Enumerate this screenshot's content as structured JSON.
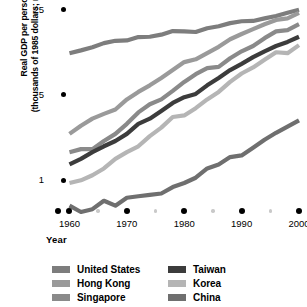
{
  "chart_data": {
    "type": "line",
    "title": "",
    "xlabel": "Year",
    "ylabel": "Real GDP per person (thousands of 1985 dollars; ratio scale)",
    "ylabel_line1": "Real GDP per person",
    "ylabel_line2": "(thousands of 1985 dollars; ratio scale)",
    "scale": "log",
    "grid": false,
    "legend_position": "bottom",
    "xlim": [
      1958,
      2000
    ],
    "ylim": [
      0.55,
      30
    ],
    "xticks": [
      1960,
      1970,
      1980,
      1990,
      2000
    ],
    "xtick_labels": [
      "1960",
      "1970",
      "1980",
      "1990",
      "2000"
    ],
    "xticks_minor": [
      1965,
      1975,
      1985,
      1995
    ],
    "yticks": [
      1,
      5,
      25
    ],
    "ytick_labels": [
      "1",
      "5",
      "25"
    ],
    "x": [
      1960,
      1962,
      1964,
      1966,
      1968,
      1970,
      1972,
      1974,
      1976,
      1978,
      1980,
      1982,
      1984,
      1986,
      1988,
      1990,
      1992,
      1994,
      1996,
      1998,
      2000
    ],
    "series": [
      {
        "name": "United States",
        "color": "#7d7d7d",
        "values": [
          11.0,
          11.6,
          12.3,
          13.3,
          13.9,
          14.0,
          14.9,
          15.0,
          15.6,
          16.7,
          16.6,
          16.4,
          17.6,
          18.3,
          19.4,
          20.1,
          20.2,
          21.2,
          22.2,
          23.6,
          25.0
        ]
      },
      {
        "name": "Hong Kong",
        "color": "#9a9a9a",
        "values": [
          2.4,
          2.8,
          3.2,
          3.5,
          3.8,
          4.6,
          5.3,
          6.0,
          6.9,
          8.0,
          9.3,
          9.8,
          11.0,
          12.4,
          14.3,
          15.8,
          17.3,
          19.0,
          20.6,
          21.2,
          23.5
        ]
      },
      {
        "name": "Singapore",
        "color": "#8a8a8a",
        "values": [
          1.7,
          1.8,
          1.8,
          2.1,
          2.4,
          2.9,
          3.6,
          4.2,
          4.6,
          5.4,
          6.4,
          7.4,
          8.3,
          8.5,
          10.0,
          11.4,
          12.6,
          14.6,
          16.6,
          17.0,
          19.0
        ]
      },
      {
        "name": "Taiwan",
        "color": "#3c3c3c",
        "values": [
          1.35,
          1.5,
          1.7,
          1.9,
          2.1,
          2.4,
          2.9,
          3.2,
          3.7,
          4.3,
          4.8,
          5.1,
          6.0,
          6.9,
          8.0,
          9.0,
          10.2,
          11.4,
          12.6,
          13.6,
          15.0
        ]
      },
      {
        "name": "Korea",
        "color": "#b5b5b5",
        "values": [
          0.95,
          1.0,
          1.1,
          1.25,
          1.5,
          1.7,
          1.9,
          2.3,
          2.7,
          3.3,
          3.4,
          3.9,
          4.6,
          5.3,
          6.4,
          7.5,
          8.4,
          9.7,
          11.2,
          11.0,
          12.8
        ]
      },
      {
        "name": "China",
        "color": "#6f6f6f",
        "values": [
          0.62,
          0.55,
          0.58,
          0.68,
          0.62,
          0.72,
          0.74,
          0.76,
          0.78,
          0.88,
          0.95,
          1.05,
          1.25,
          1.35,
          1.55,
          1.6,
          1.85,
          2.15,
          2.45,
          2.75,
          3.1
        ]
      }
    ]
  },
  "legend": {
    "columns": [
      {
        "items": [
          {
            "label": "United States",
            "color": "#7d7d7d"
          },
          {
            "label": "Hong Kong",
            "color": "#9a9a9a"
          },
          {
            "label": "Singapore",
            "color": "#8a8a8a"
          }
        ]
      },
      {
        "items": [
          {
            "label": "Taiwan",
            "color": "#3c3c3c"
          },
          {
            "label": "Korea",
            "color": "#b5b5b5"
          },
          {
            "label": "China",
            "color": "#6f6f6f"
          }
        ]
      }
    ]
  }
}
